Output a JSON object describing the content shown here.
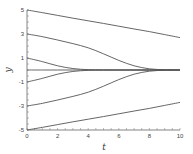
{
  "chart_data": {
    "type": "line",
    "title": "",
    "xlabel": "t",
    "ylabel": "y",
    "xlim": [
      0,
      10
    ],
    "ylim": [
      -5,
      5
    ],
    "x_ticks": [
      0,
      2,
      4,
      6,
      8,
      10
    ],
    "y_ticks": [
      -5,
      -3,
      -1,
      1,
      3,
      5
    ],
    "grid": false,
    "legend": null,
    "line_color": "#555555",
    "x": [
      0,
      1,
      2,
      3,
      4,
      5,
      6,
      7,
      8,
      9,
      10
    ],
    "series": [
      {
        "name": "y0=5",
        "values": [
          5.0,
          4.78,
          4.55,
          4.32,
          4.1,
          3.88,
          3.65,
          3.42,
          3.2,
          2.95,
          2.7
        ]
      },
      {
        "name": "y0=3",
        "values": [
          3.0,
          2.78,
          2.5,
          2.2,
          1.85,
          1.35,
          0.8,
          0.35,
          0.1,
          0.02,
          0.0
        ]
      },
      {
        "name": "y0=1",
        "values": [
          1.0,
          0.7,
          0.35,
          0.12,
          0.03,
          0.01,
          0.0,
          0.0,
          0.0,
          0.0,
          0.0
        ]
      },
      {
        "name": "y0=0",
        "values": [
          0,
          0,
          0,
          0,
          0,
          0,
          0,
          0,
          0,
          0,
          0
        ]
      },
      {
        "name": "y0=-1",
        "values": [
          -1.0,
          -0.7,
          -0.35,
          -0.12,
          -0.03,
          -0.01,
          0.0,
          0.0,
          0.0,
          0.0,
          0.0
        ]
      },
      {
        "name": "y0=-3",
        "values": [
          -3.0,
          -2.78,
          -2.5,
          -2.2,
          -1.85,
          -1.35,
          -0.8,
          -0.35,
          -0.1,
          -0.02,
          0.0
        ]
      },
      {
        "name": "y0=-5",
        "values": [
          -5.0,
          -4.78,
          -4.55,
          -4.32,
          -4.1,
          -3.88,
          -3.65,
          -3.42,
          -3.2,
          -2.95,
          -2.7
        ]
      }
    ]
  }
}
